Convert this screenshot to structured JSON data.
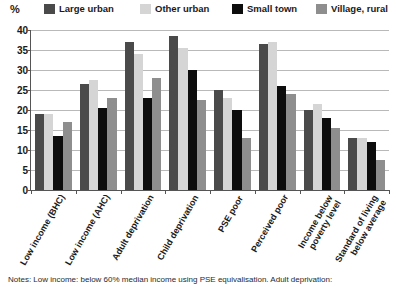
{
  "axis": {
    "y_unit_label": "%",
    "y_ticks": [
      "40",
      "35",
      "30",
      "25",
      "20",
      "15",
      "10",
      "5",
      "0"
    ]
  },
  "legend": [
    {
      "label": "Large urban",
      "color": "#4a4a4a",
      "icon": "legend-swatch-icon"
    },
    {
      "label": "Other urban",
      "color": "#d5d5d5",
      "icon": "legend-swatch-icon"
    },
    {
      "label": "Small town",
      "color": "#0d0d0d",
      "icon": "legend-swatch-icon"
    },
    {
      "label": "Village, rural",
      "color": "#8e8e8e",
      "icon": "legend-swatch-icon"
    }
  ],
  "footnote": "Notes: Low income: below 60% median income using PSE equivalisation. Adult deprivation:",
  "chart_data": {
    "type": "bar",
    "title": "",
    "xlabel": "",
    "ylabel": "%",
    "ylim": [
      0,
      40
    ],
    "ytick_step": 5,
    "grid": true,
    "legend_position": "top",
    "categories": [
      "Low income (BHC)",
      "Low income (AHC)",
      "Adult deprivation",
      "Child deprivation",
      "PSE poor",
      "Perceived poor",
      "Income below poverty level",
      "Standard of living below average"
    ],
    "category_lines": [
      [
        "Low income (BHC)"
      ],
      [
        "Low income (AHC)"
      ],
      [
        "Adult deprivation"
      ],
      [
        "Child deprivation"
      ],
      [
        "PSE poor"
      ],
      [
        "Perceived poor"
      ],
      [
        "Income below",
        "poverty level"
      ],
      [
        "Standard of living",
        "below average"
      ]
    ],
    "series": [
      {
        "name": "Large urban",
        "color": "#4a4a4a",
        "values": [
          19,
          26.5,
          37,
          38.5,
          25,
          36.5,
          20,
          13
        ]
      },
      {
        "name": "Other urban",
        "color": "#d5d5d5",
        "values": [
          19,
          27.5,
          34,
          35.5,
          23,
          37,
          21.5,
          13
        ]
      },
      {
        "name": "Small town",
        "color": "#0d0d0d",
        "values": [
          13.5,
          20.5,
          23,
          30,
          20,
          26,
          18,
          12
        ]
      },
      {
        "name": "Village, rural",
        "color": "#8e8e8e",
        "values": [
          17,
          23,
          28,
          22.5,
          13,
          24,
          15.5,
          7.5
        ]
      }
    ]
  }
}
